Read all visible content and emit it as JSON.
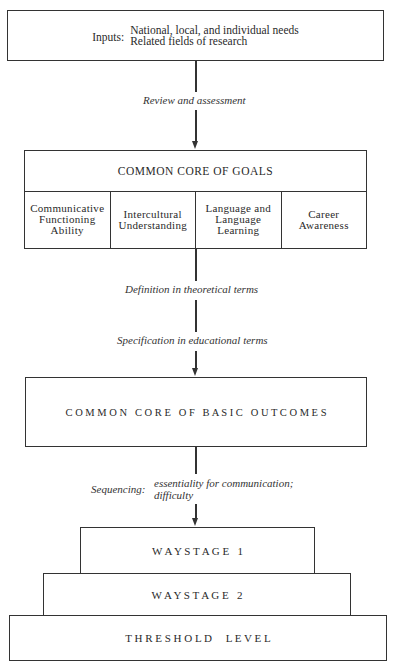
{
  "diagram": {
    "inputs": {
      "key": "Inputs:",
      "lines": [
        "National, local, and individual needs",
        "Related fields of research"
      ]
    },
    "steps": {
      "review": "Review and assessment",
      "definition": "Definition in theoretical terms",
      "specification": "Specification in educational terms",
      "sequencing_key": "Sequencing:",
      "sequencing_lines": [
        "essentiality for communication;",
        "difficulty"
      ]
    },
    "goals": {
      "title": "COMMON CORE OF GOALS",
      "columns": [
        {
          "lines": [
            "Communicative",
            "Functioning",
            "Ability"
          ]
        },
        {
          "lines": [
            "Intercultural",
            "Understanding"
          ]
        },
        {
          "lines": [
            "Language and",
            "Language",
            "Learning"
          ]
        },
        {
          "lines": [
            "Career",
            "Awareness"
          ]
        }
      ]
    },
    "outcomes": {
      "title": "C O M M O N   C O R E   O F   B A S I C   O U T C O M E S"
    },
    "levels": [
      {
        "label": "W A Y S T A G E   1"
      },
      {
        "label": "W A Y S T A G E   2"
      },
      {
        "label": "T H R E S H O L D     L E V E L"
      }
    ]
  }
}
